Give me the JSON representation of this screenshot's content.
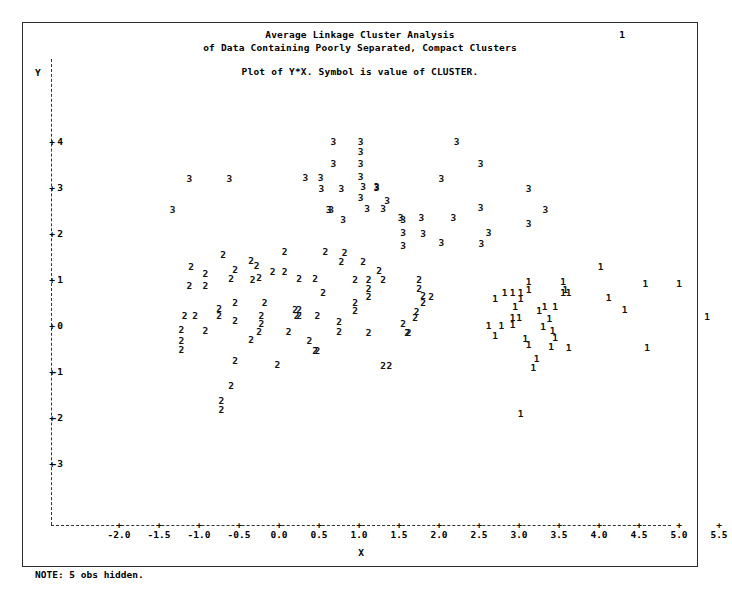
{
  "page": {
    "page_number": "1",
    "title_line1": "Average Linkage Cluster Analysis",
    "title_line2": "of Data Containing Poorly Separated, Compact Clusters",
    "subtitle": "Plot of Y*X. Symbol is value of CLUSTER.",
    "note": "NOTE:  5 obs hidden.",
    "frame_color": "#2a2a2a",
    "text_color": "#000000",
    "background_color": "#ffffff"
  },
  "chart_data": {
    "type": "scatter",
    "title": "Average Linkage Cluster Analysis of Data Containing Poorly Separated, Compact Clusters",
    "subtitle": "Plot of Y*X. Symbol is value of CLUSTER.",
    "xlabel": "X",
    "ylabel": "Y",
    "xlim": [
      -2.55,
      5.95
    ],
    "ylim": [
      -3.6,
      4.7
    ],
    "grid": false,
    "legend": "none",
    "symbol_meaning": "Symbol is value of CLUSTER",
    "xticks": [
      "-2.0",
      "-1.5",
      "-1.0",
      "-0.5",
      "0.0",
      "0.5",
      "1.0",
      "1.5",
      "2.0",
      "2.5",
      "3.0",
      "3.5",
      "4.0",
      "4.5",
      "5.0",
      "5.5"
    ],
    "xtick_values": [
      -2.0,
      -1.5,
      -1.0,
      -0.5,
      0.0,
      0.5,
      1.0,
      1.5,
      2.0,
      2.5,
      3.0,
      3.5,
      4.0,
      4.5,
      5.0,
      5.5
    ],
    "yticks": [
      "4",
      "3",
      "2",
      "1",
      "0",
      "-1",
      "-2",
      "-3"
    ],
    "ytick_values": [
      4,
      3,
      2,
      1,
      0,
      -1,
      -2,
      -3
    ],
    "series": [
      {
        "name": "Cluster 3",
        "symbol": "3",
        "points": [
          [
            0.68,
            4.0
          ],
          [
            1.02,
            4.0
          ],
          [
            2.22,
            4.0
          ],
          [
            1.02,
            3.78
          ],
          [
            0.68,
            3.53
          ],
          [
            2.52,
            3.53
          ],
          [
            1.02,
            3.53
          ],
          [
            -1.12,
            3.2
          ],
          [
            -0.62,
            3.2
          ],
          [
            0.33,
            3.22
          ],
          [
            0.52,
            3.22
          ],
          [
            1.02,
            3.25
          ],
          [
            1.05,
            3.03
          ],
          [
            1.22,
            3.0
          ],
          [
            2.03,
            3.2
          ],
          [
            1.22,
            3.03
          ],
          [
            0.53,
            2.97
          ],
          [
            0.78,
            2.97
          ],
          [
            1.02,
            2.78
          ],
          [
            3.12,
            2.97
          ],
          [
            1.35,
            2.72
          ],
          [
            -1.33,
            2.52
          ],
          [
            0.62,
            2.52
          ],
          [
            0.65,
            2.52
          ],
          [
            1.1,
            2.55
          ],
          [
            1.3,
            2.55
          ],
          [
            2.52,
            2.57
          ],
          [
            1.52,
            2.35
          ],
          [
            1.78,
            2.35
          ],
          [
            2.18,
            2.35
          ],
          [
            3.33,
            2.52
          ],
          [
            0.8,
            2.3
          ],
          [
            1.55,
            2.3
          ],
          [
            3.12,
            2.22
          ],
          [
            1.55,
            2.03
          ],
          [
            1.8,
            2.0
          ],
          [
            2.62,
            2.02
          ],
          [
            2.03,
            1.8
          ],
          [
            1.55,
            1.75
          ],
          [
            2.53,
            1.78
          ]
        ]
      },
      {
        "name": "Cluster 2",
        "symbol": "2",
        "points": [
          [
            -0.7,
            1.55
          ],
          [
            0.07,
            1.6
          ],
          [
            0.58,
            1.6
          ],
          [
            0.82,
            1.58
          ],
          [
            -0.35,
            1.42
          ],
          [
            0.78,
            1.4
          ],
          [
            1.05,
            1.4
          ],
          [
            -1.1,
            1.28
          ],
          [
            -0.28,
            1.3
          ],
          [
            -0.55,
            1.22
          ],
          [
            -0.08,
            1.18
          ],
          [
            0.07,
            1.18
          ],
          [
            1.25,
            1.2
          ],
          [
            -0.92,
            1.12
          ],
          [
            -0.25,
            1.05
          ],
          [
            -0.6,
            1.02
          ],
          [
            -0.33,
            1.0
          ],
          [
            0.25,
            1.02
          ],
          [
            0.45,
            1.02
          ],
          [
            0.95,
            1.0
          ],
          [
            1.12,
            1.0
          ],
          [
            1.3,
            1.0
          ],
          [
            1.75,
            1.0
          ],
          [
            -1.12,
            0.88
          ],
          [
            -0.92,
            0.88
          ],
          [
            1.12,
            0.8
          ],
          [
            1.75,
            0.8
          ],
          [
            0.55,
            0.72
          ],
          [
            1.12,
            0.62
          ],
          [
            1.8,
            0.65
          ],
          [
            1.9,
            0.62
          ],
          [
            -0.55,
            0.5
          ],
          [
            -0.18,
            0.5
          ],
          [
            0.95,
            0.5
          ],
          [
            1.8,
            0.5
          ],
          [
            -0.75,
            0.38
          ],
          [
            0.2,
            0.35
          ],
          [
            0.25,
            0.35
          ],
          [
            0.95,
            0.33
          ],
          [
            1.72,
            0.3
          ],
          [
            -1.18,
            0.22
          ],
          [
            -1.05,
            0.22
          ],
          [
            -0.75,
            0.22
          ],
          [
            -0.22,
            0.22
          ],
          [
            0.22,
            0.22
          ],
          [
            0.25,
            0.22
          ],
          [
            0.48,
            0.22
          ],
          [
            1.7,
            0.18
          ],
          [
            -0.55,
            0.1
          ],
          [
            -0.22,
            0.05
          ],
          [
            0.75,
            0.08
          ],
          [
            1.55,
            0.05
          ],
          [
            -1.22,
            -0.08
          ],
          [
            -0.92,
            -0.1
          ],
          [
            -0.25,
            -0.12
          ],
          [
            0.12,
            -0.12
          ],
          [
            0.75,
            -0.12
          ],
          [
            1.12,
            -0.15
          ],
          [
            1.6,
            -0.15
          ],
          [
            1.62,
            -0.15
          ],
          [
            -1.22,
            -0.32
          ],
          [
            -0.35,
            -0.3
          ],
          [
            0.38,
            -0.32
          ],
          [
            -1.22,
            -0.52
          ],
          [
            0.45,
            -0.55
          ],
          [
            0.48,
            -0.55
          ],
          [
            -0.55,
            -0.75
          ],
          [
            -0.02,
            -0.85
          ],
          [
            1.3,
            -0.88
          ],
          [
            1.38,
            -0.88
          ],
          [
            -0.6,
            -1.3
          ],
          [
            -0.72,
            -1.62
          ],
          [
            -0.72,
            -1.82
          ]
        ]
      },
      {
        "name": "Cluster 1",
        "symbol": "1",
        "points": [
          [
            4.02,
            1.28
          ],
          [
            3.12,
            0.95
          ],
          [
            3.55,
            0.95
          ],
          [
            4.58,
            0.92
          ],
          [
            5.0,
            0.92
          ],
          [
            3.12,
            0.78
          ],
          [
            3.58,
            0.78
          ],
          [
            2.82,
            0.72
          ],
          [
            2.92,
            0.72
          ],
          [
            3.02,
            0.72
          ],
          [
            3.55,
            0.72
          ],
          [
            3.62,
            0.72
          ],
          [
            2.7,
            0.58
          ],
          [
            3.02,
            0.58
          ],
          [
            4.12,
            0.6
          ],
          [
            2.95,
            0.42
          ],
          [
            3.32,
            0.42
          ],
          [
            3.45,
            0.42
          ],
          [
            3.25,
            0.32
          ],
          [
            4.32,
            0.35
          ],
          [
            5.35,
            0.2
          ],
          [
            2.92,
            0.18
          ],
          [
            3.0,
            0.18
          ],
          [
            3.38,
            0.15
          ],
          [
            2.62,
            0.0
          ],
          [
            2.78,
            0.0
          ],
          [
            2.92,
            0.02
          ],
          [
            3.3,
            -0.02
          ],
          [
            3.42,
            -0.1
          ],
          [
            2.7,
            -0.22
          ],
          [
            3.45,
            -0.25
          ],
          [
            3.08,
            -0.28
          ],
          [
            3.12,
            -0.42
          ],
          [
            3.4,
            -0.45
          ],
          [
            3.62,
            -0.48
          ],
          [
            4.6,
            -0.48
          ],
          [
            3.22,
            -0.72
          ],
          [
            3.18,
            -0.92
          ],
          [
            3.02,
            -1.92
          ]
        ]
      }
    ]
  }
}
